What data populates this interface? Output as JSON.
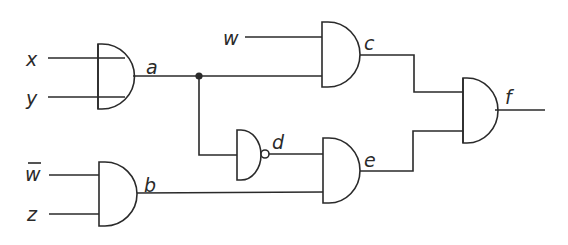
{
  "diagram": {
    "type": "logic-circuit",
    "inputs": [
      {
        "id": "x",
        "label": "x"
      },
      {
        "id": "y",
        "label": "y"
      },
      {
        "id": "w",
        "label": "w"
      },
      {
        "id": "w_bar",
        "label": "w",
        "overbar": true
      },
      {
        "id": "z",
        "label": "z"
      }
    ],
    "gates": [
      {
        "id": "a",
        "label": "a",
        "type": "AND",
        "inputs": [
          "x",
          "y"
        ],
        "note": "input lines extend into gate body"
      },
      {
        "id": "b",
        "label": "b",
        "type": "AND",
        "inputs": [
          "w_bar",
          "z"
        ]
      },
      {
        "id": "c",
        "label": "c",
        "type": "AND",
        "inputs": [
          "w",
          "a"
        ]
      },
      {
        "id": "d",
        "label": "d",
        "type": "NOT-AND (inverted output)",
        "inputs": [
          "a"
        ]
      },
      {
        "id": "e",
        "label": "e",
        "type": "AND",
        "inputs": [
          "d",
          "b"
        ]
      },
      {
        "id": "f",
        "label": "f",
        "type": "AND",
        "inputs": [
          "c",
          "e"
        ],
        "note": "input lines extend into gate body"
      }
    ],
    "junctions": [
      {
        "net": "a",
        "label": "fan-out dot"
      }
    ],
    "output": "f",
    "stroke_color": "#2a2a2a",
    "background": "#ffffff"
  }
}
